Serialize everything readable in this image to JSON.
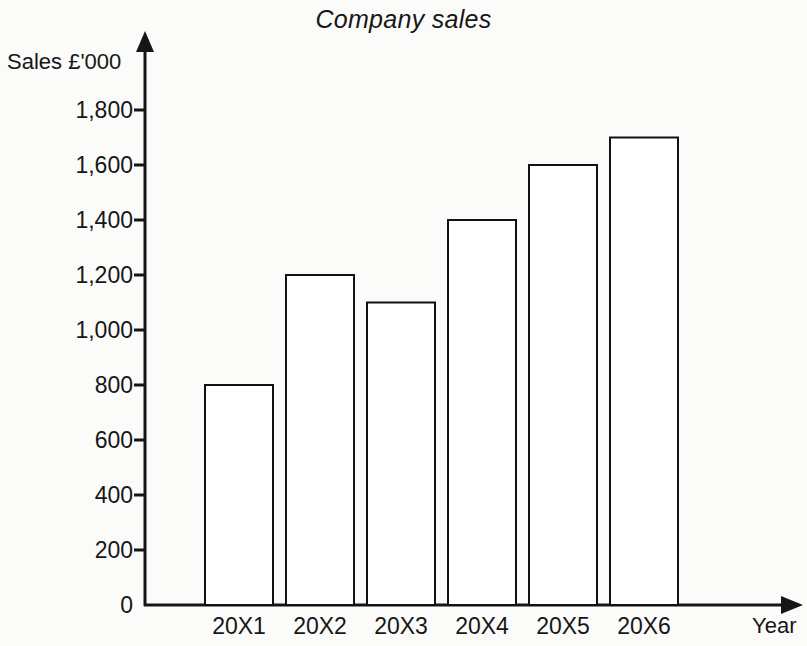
{
  "chart_data": {
    "type": "bar",
    "title": "Company sales",
    "xlabel": "Year",
    "ylabel": "Sales £'000",
    "categories": [
      "20X1",
      "20X2",
      "20X3",
      "20X4",
      "20X5",
      "20X6"
    ],
    "values": [
      800,
      1200,
      1100,
      1400,
      1600,
      1700
    ],
    "series": [
      {
        "name": "Company sales",
        "values": [
          800,
          1200,
          1100,
          1400,
          1600,
          1700
        ]
      }
    ],
    "ylim": [
      0,
      1800
    ],
    "ytick_values": [
      0,
      200,
      400,
      600,
      800,
      1000,
      1200,
      1400,
      1600,
      1800
    ],
    "ytick_labels": [
      "0",
      "200",
      "400",
      "600",
      "800",
      "1,000",
      "1,200",
      "1,400",
      "1,600",
      "1,800"
    ],
    "grid": false,
    "legend": false,
    "legend_position": "none",
    "bar_style": {
      "fill": "#ffffff",
      "stroke": "#111111",
      "stroke_width": 2
    },
    "axis_style": {
      "color": "#161616",
      "arrow_heads": true
    }
  }
}
